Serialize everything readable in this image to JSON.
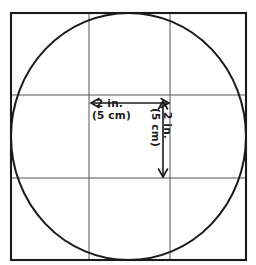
{
  "diagram": {
    "background_color": "#ffffff",
    "stroke_color": "#1a1a1a",
    "grid_color": "#555555",
    "square": {
      "label": "outer-square",
      "x": 11,
      "y": 13,
      "width": 235,
      "height": 247,
      "stroke_width": 2.1
    },
    "circle": {
      "label": "inscribed-circle",
      "cx": 128.5,
      "cy": 136.5,
      "rx": 117.5,
      "ry": 123.5,
      "stroke_width": 2.0
    },
    "grid": {
      "vertical_lines": [
        89,
        170
      ],
      "horizontal_lines": [
        95,
        178
      ],
      "stroke_width": 1.0
    },
    "dimensions": {
      "horizontal": {
        "name": "horizontal-dimension",
        "value_inches": "2 in.",
        "value_metric": "(5 cm)",
        "arrow_y": 103,
        "arrow_x_start": 89,
        "arrow_x_end": 170
      },
      "vertical": {
        "name": "vertical-dimension",
        "value_inches": "2 in.",
        "value_metric": "(5 cm)",
        "arrow_x": 163,
        "arrow_y_start": 100,
        "arrow_y_end": 178
      }
    }
  }
}
